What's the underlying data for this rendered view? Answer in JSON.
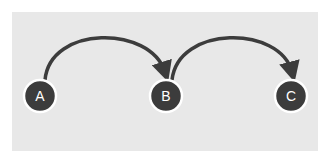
{
  "diagram": {
    "type": "flow",
    "colors": {
      "background": "#e8e8e8",
      "node_fill": "#3c3c3c",
      "node_ring": "#ffffff",
      "node_label": "#ffffff",
      "edge": "#3c3c3c"
    },
    "nodes": [
      {
        "id": "A",
        "label": "A"
      },
      {
        "id": "B",
        "label": "B"
      },
      {
        "id": "C",
        "label": "C"
      }
    ],
    "edges": [
      {
        "from": "A",
        "to": "B",
        "directed": true
      },
      {
        "from": "B",
        "to": "C",
        "directed": true
      }
    ]
  }
}
